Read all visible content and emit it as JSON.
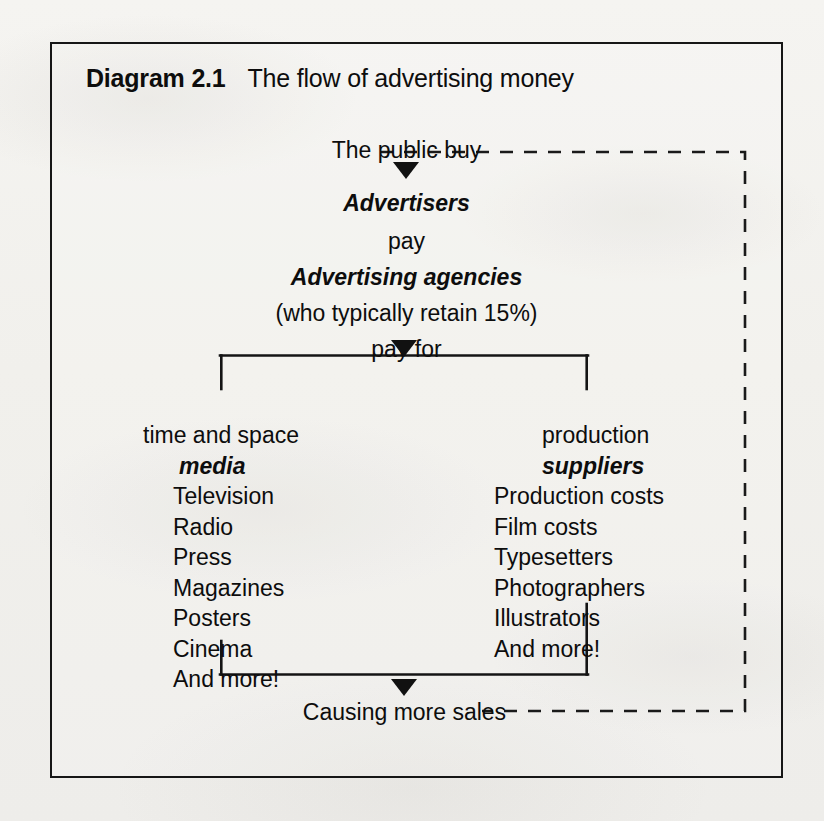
{
  "title": {
    "number": "Diagram 2.1",
    "caption": "The flow of advertising money"
  },
  "flow": {
    "start": "The public buy",
    "advertisers": "Advertisers",
    "pay": "pay",
    "agencies": "Advertising agencies",
    "agencies_note": "(who typically retain 15%)",
    "pay_for": "pay for",
    "outcome": "Causing more sales"
  },
  "columns": {
    "left": {
      "heading": "time and space",
      "subheading": "media",
      "items": [
        "Television",
        "Radio",
        "Press",
        "Magazines",
        "Posters",
        "Cinema",
        "And more!"
      ]
    },
    "right": {
      "heading": "production",
      "subheading": "suppliers",
      "items": [
        "Production costs",
        "Film costs",
        "Typesetters",
        "Photographers",
        "Illustrators",
        "And more!"
      ]
    }
  },
  "colors": {
    "ink": "#111111",
    "paper": "#f1f0ec",
    "border": "#161616"
  }
}
